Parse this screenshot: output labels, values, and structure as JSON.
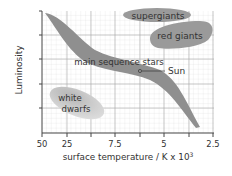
{
  "diagram": {
    "y_axis": {
      "label": "Luminosity"
    },
    "x_axis": {
      "label": "surface temperature / K x 10",
      "label_superscript": "3",
      "ticks": [
        "50",
        "25",
        "",
        "7.5",
        "",
        "5",
        "",
        "2.5"
      ]
    },
    "regions": {
      "supergiants": "supergiants",
      "red_giants": "red giants",
      "main_sequence": "main sequence stars",
      "sun": "Sun",
      "white_dwarfs": "white dwarfs",
      "white_dwarfs_line1": "white",
      "white_dwarfs_line2": "dwarfs"
    },
    "colors": {
      "grid_minor": "#d8d8d8",
      "grid_major": "#a8a8a8",
      "axis": "#444444",
      "main_sequence": "#8f8f8f",
      "giants": "#9a9a9a",
      "white_dwarfs": "#c8c8c8",
      "text": "#333333"
    }
  }
}
